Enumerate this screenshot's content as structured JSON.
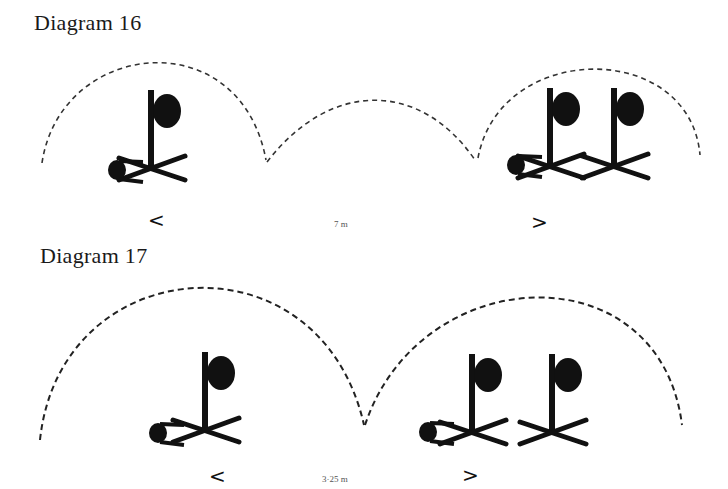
{
  "diagrams": [
    {
      "title": "Diagram 16",
      "distance_label": "7 m",
      "left_arrow": "<",
      "right_arrow": ">",
      "arcs": 3,
      "stations": [
        {
          "position": "left",
          "figures": 1
        },
        {
          "position": "right",
          "figures": 2
        }
      ]
    },
    {
      "title": "Diagram 17",
      "distance_label": "3·25 m",
      "left_arrow": "<",
      "right_arrow": ">",
      "arcs": 2,
      "stations": [
        {
          "position": "left",
          "figures": 1
        },
        {
          "position": "right",
          "figures": 2
        }
      ]
    }
  ],
  "colors": {
    "ink": "#111111",
    "dash": "#333333",
    "background": "#ffffff"
  }
}
